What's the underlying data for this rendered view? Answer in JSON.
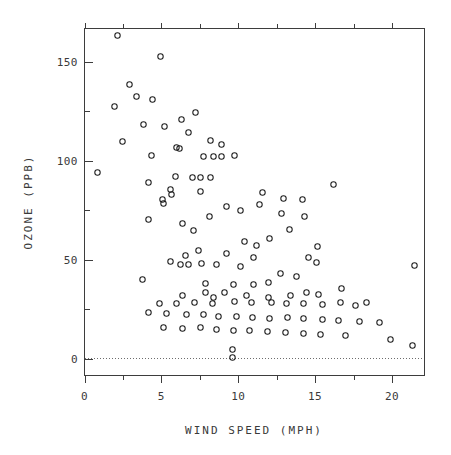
{
  "figure": {
    "top_clipped_text": "",
    "background_color": "#ffffff",
    "frame_color": "#3d3d3d",
    "marker_color": "#1c1c1c",
    "ref_line_color": "#6d6d6d"
  },
  "chart_data": {
    "type": "scatter",
    "title": "",
    "xlabel": "WIND SPEED (MPH)",
    "ylabel": "OZONE (PPB)",
    "xlim": [
      -0.5,
      22.0
    ],
    "ylim": [
      -9.0,
      176.0
    ],
    "grid": false,
    "legend": null,
    "xticks": [
      0,
      5,
      10,
      15,
      20
    ],
    "xtick_labels": [
      "0",
      "5",
      "10",
      "15",
      "20"
    ],
    "xminor_ticks": [
      2.5,
      7.5,
      12.5,
      17.5
    ],
    "yticks": [
      0,
      50,
      100,
      150
    ],
    "ytick_labels": [
      "0",
      "50",
      "100",
      "150"
    ],
    "yminor_ticks": [
      25,
      75,
      125,
      175
    ],
    "reference_lines": [
      {
        "axis": "y",
        "value": 0,
        "style": "dotted"
      }
    ],
    "marker": "open-circle",
    "marker_size": 5.4,
    "n_points": 116,
    "points": [
      [
        7.4,
        41
      ],
      [
        8.0,
        36
      ],
      [
        12.6,
        12
      ],
      [
        11.5,
        18
      ],
      [
        8.6,
        23
      ],
      [
        13.8,
        19
      ],
      [
        20.1,
        8
      ],
      [
        8.6,
        16
      ],
      [
        6.9,
        11
      ],
      [
        9.7,
        14
      ],
      [
        9.2,
        18
      ],
      [
        10.9,
        14
      ],
      [
        13.2,
        34
      ],
      [
        11.5,
        6
      ],
      [
        12.0,
        30
      ],
      [
        18.4,
        11
      ],
      [
        11.5,
        1
      ],
      [
        9.7,
        11
      ],
      [
        9.7,
        4
      ],
      [
        16.6,
        32
      ],
      [
        9.7,
        23
      ],
      [
        12.0,
        45
      ],
      [
        16.6,
        115
      ],
      [
        14.9,
        37
      ],
      [
        8.0,
        29
      ],
      [
        12.0,
        71
      ],
      [
        14.9,
        39
      ],
      [
        5.7,
        23
      ],
      [
        7.4,
        21
      ],
      [
        8.6,
        37
      ],
      [
        9.7,
        20
      ],
      [
        16.1,
        12
      ],
      [
        9.2,
        13
      ],
      [
        8.6,
        135
      ],
      [
        14.3,
        49
      ],
      [
        9.7,
        32
      ],
      [
        9.2,
        64
      ],
      [
        6.9,
        40
      ],
      [
        13.8,
        77
      ],
      [
        11.5,
        97
      ],
      [
        10.9,
        97
      ],
      [
        9.2,
        85
      ],
      [
        8.0,
        10
      ],
      [
        13.8,
        27
      ],
      [
        11.5,
        7
      ],
      [
        14.9,
        48
      ],
      [
        20.7,
        35
      ],
      [
        9.2,
        61
      ],
      [
        11.5,
        79
      ],
      [
        10.3,
        63
      ],
      [
        6.3,
        16
      ],
      [
        1.7,
        80
      ],
      [
        4.6,
        108
      ],
      [
        6.3,
        20
      ],
      [
        8.0,
        52
      ],
      [
        8.0,
        82
      ],
      [
        10.3,
        50
      ],
      [
        11.5,
        64
      ],
      [
        14.9,
        59
      ],
      [
        8.0,
        39
      ],
      [
        4.1,
        9
      ],
      [
        9.2,
        16,
        0
      ],
      [
        9.2,
        78
      ],
      [
        10.9,
        35
      ],
      [
        4.6,
        66
      ],
      [
        10.9,
        122
      ],
      [
        5.1,
        89
      ],
      [
        6.3,
        110
      ],
      [
        5.7,
        44
      ],
      [
        7.4,
        28
      ],
      [
        8.6,
        65
      ],
      [
        14.3,
        22
      ],
      [
        14.9,
        59
      ],
      [
        14.9,
        23
      ],
      [
        14.3,
        31
      ],
      [
        6.9,
        44
      ],
      [
        10.3,
        21
      ],
      [
        6.3,
        9
      ],
      [
        5.1,
        45
      ],
      [
        6.3,
        168
      ],
      [
        6.3,
        73
      ],
      [
        5.7,
        76
      ],
      [
        7.4,
        118
      ],
      [
        8.6,
        84
      ],
      [
        14.3,
        85
      ],
      [
        8.0,
        96
      ],
      [
        11.5,
        78
      ],
      [
        14.9,
        73
      ],
      [
        20.7,
        91
      ],
      [
        9.2,
        47
      ],
      [
        11.5,
        32
      ],
      [
        10.3,
        20
      ],
      [
        6.3,
        23
      ],
      [
        1.7,
        21
      ],
      [
        4.6,
        24
      ],
      [
        6.3,
        44
      ],
      [
        8.0,
        21
      ],
      [
        8.0,
        28
      ],
      [
        10.3,
        9
      ],
      [
        11.5,
        13
      ],
      [
        14.3,
        46
      ],
      [
        8.0,
        18
      ],
      [
        11.5,
        13
      ],
      [
        11.5,
        24
      ],
      [
        9.7,
        16
      ],
      [
        11.5,
        13
      ],
      [
        10.3,
        23
      ],
      [
        6.3,
        36
      ],
      [
        7.4,
        7
      ],
      [
        10.9,
        14
      ],
      [
        10.3,
        30
      ],
      [
        15.5,
        14
      ],
      [
        14.3,
        18
      ],
      [
        12.6,
        20
      ],
      [
        9.7,
        9
      ]
    ],
    "pixel_points": [
      [
        117,
        35
      ],
      [
        160,
        56
      ],
      [
        129,
        84
      ],
      [
        136,
        96
      ],
      [
        152,
        99
      ],
      [
        114,
        106
      ],
      [
        195,
        112
      ],
      [
        181,
        119
      ],
      [
        143,
        124
      ],
      [
        164,
        126
      ],
      [
        188,
        132
      ],
      [
        210,
        140
      ],
      [
        122,
        141
      ],
      [
        221,
        144
      ],
      [
        176,
        147
      ],
      [
        179,
        148
      ],
      [
        151,
        155
      ],
      [
        203,
        156
      ],
      [
        213,
        156
      ],
      [
        221,
        156
      ],
      [
        234,
        155
      ],
      [
        97,
        172
      ],
      [
        175,
        176
      ],
      [
        192,
        177
      ],
      [
        200,
        177
      ],
      [
        210,
        177
      ],
      [
        148,
        182
      ],
      [
        333,
        184
      ],
      [
        170,
        189
      ],
      [
        171,
        194
      ],
      [
        200,
        191
      ],
      [
        262,
        192
      ],
      [
        162,
        199
      ],
      [
        163,
        203
      ],
      [
        283,
        198
      ],
      [
        302,
        199
      ],
      [
        226,
        206
      ],
      [
        240,
        210
      ],
      [
        259,
        204
      ],
      [
        281,
        213
      ],
      [
        209,
        216
      ],
      [
        148,
        219
      ],
      [
        304,
        216
      ],
      [
        182,
        223
      ],
      [
        193,
        230
      ],
      [
        289,
        229
      ],
      [
        269,
        238
      ],
      [
        244,
        241
      ],
      [
        256,
        245
      ],
      [
        317,
        246
      ],
      [
        198,
        250
      ],
      [
        226,
        253
      ],
      [
        185,
        255
      ],
      [
        253,
        257
      ],
      [
        308,
        257
      ],
      [
        170,
        261
      ],
      [
        188,
        264
      ],
      [
        180,
        264
      ],
      [
        201,
        263
      ],
      [
        216,
        264
      ],
      [
        240,
        266
      ],
      [
        316,
        262
      ],
      [
        414,
        265
      ],
      [
        280,
        273
      ],
      [
        296,
        276
      ],
      [
        268,
        282
      ],
      [
        142,
        279
      ],
      [
        205,
        283
      ],
      [
        233,
        284
      ],
      [
        253,
        284
      ],
      [
        205,
        292
      ],
      [
        224,
        292
      ],
      [
        182,
        295
      ],
      [
        213,
        297
      ],
      [
        246,
        295
      ],
      [
        268,
        297
      ],
      [
        290,
        295
      ],
      [
        306,
        292
      ],
      [
        318,
        294
      ],
      [
        341,
        288
      ],
      [
        159,
        303
      ],
      [
        176,
        303
      ],
      [
        194,
        302
      ],
      [
        212,
        303
      ],
      [
        234,
        301
      ],
      [
        251,
        302
      ],
      [
        271,
        302
      ],
      [
        286,
        303
      ],
      [
        303,
        303
      ],
      [
        322,
        304
      ],
      [
        340,
        302
      ],
      [
        355,
        305
      ],
      [
        366,
        302
      ],
      [
        148,
        312
      ],
      [
        166,
        313
      ],
      [
        186,
        314
      ],
      [
        203,
        314
      ],
      [
        218,
        316
      ],
      [
        236,
        316
      ],
      [
        252,
        317
      ],
      [
        269,
        318
      ],
      [
        287,
        317
      ],
      [
        303,
        318
      ],
      [
        322,
        319
      ],
      [
        338,
        320
      ],
      [
        359,
        321
      ],
      [
        379,
        322
      ],
      [
        163,
        327
      ],
      [
        182,
        328
      ],
      [
        200,
        327
      ],
      [
        216,
        329
      ],
      [
        233,
        330
      ],
      [
        249,
        330
      ],
      [
        267,
        331
      ],
      [
        285,
        332
      ],
      [
        303,
        333
      ],
      [
        320,
        334
      ],
      [
        345,
        335
      ],
      [
        390,
        339
      ],
      [
        412,
        345
      ],
      [
        232,
        349
      ],
      [
        232,
        357
      ]
    ]
  }
}
